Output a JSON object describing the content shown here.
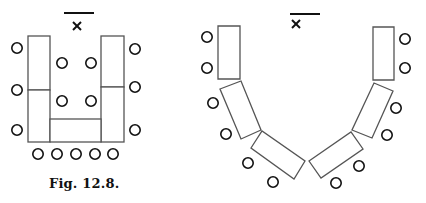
{
  "caption": "Fig. 12.8.",
  "colors": {
    "background": "#ffffff",
    "table_stroke": "#555555",
    "seat_stroke": "#111111",
    "ink": "#111111"
  },
  "legend_marks": {
    "board": "horizontal line (front of room)",
    "teacher": "x-mark (teacher position)"
  },
  "figures": [
    {
      "name": "u-shaped-layout",
      "board_line": {
        "x1": 64,
        "y1": 13,
        "x2": 94,
        "y2": 13
      },
      "teacher_mark": {
        "cx": 77,
        "cy": 26
      },
      "tables": [
        {
          "id": "left-upper",
          "x": 28,
          "y": 36,
          "w": 22,
          "h": 54
        },
        {
          "id": "left-lower",
          "x": 28,
          "y": 90,
          "w": 22,
          "h": 52
        },
        {
          "id": "right-upper",
          "x": 101,
          "y": 36,
          "w": 23,
          "h": 51
        },
        {
          "id": "right-lower",
          "x": 101,
          "y": 87,
          "w": 23,
          "h": 55
        },
        {
          "id": "bottom",
          "x": 50,
          "y": 119,
          "w": 51,
          "h": 23
        }
      ],
      "seats": [
        {
          "cx": 17,
          "cy": 48
        },
        {
          "cx": 17,
          "cy": 90
        },
        {
          "cx": 17,
          "cy": 130
        },
        {
          "cx": 135,
          "cy": 49
        },
        {
          "cx": 135,
          "cy": 87
        },
        {
          "cx": 135,
          "cy": 130
        },
        {
          "cx": 62,
          "cy": 63
        },
        {
          "cx": 91,
          "cy": 63
        },
        {
          "cx": 62,
          "cy": 101
        },
        {
          "cx": 91,
          "cy": 101
        },
        {
          "cx": 38,
          "cy": 154
        },
        {
          "cx": 57,
          "cy": 154
        },
        {
          "cx": 76,
          "cy": 154
        },
        {
          "cx": 95,
          "cy": 154
        },
        {
          "cx": 113,
          "cy": 154
        }
      ]
    },
    {
      "name": "v-shaped-layout",
      "board_line": {
        "x1": 290,
        "y1": 14,
        "x2": 320,
        "y2": 14
      },
      "teacher_mark": {
        "cx": 296,
        "cy": 24
      },
      "tables": [
        {
          "id": "left-1",
          "points": "218,26 240,26 240,79 218,79"
        },
        {
          "id": "left-2",
          "points": "220,89 241,81 261,130 241,139"
        },
        {
          "id": "left-3",
          "points": "251,148 262,131 305,161 294,179"
        },
        {
          "id": "right-3",
          "points": "309,161 351,132 363,149 321,178"
        },
        {
          "id": "right-2",
          "points": "374,83 393,91 372,138 352,130"
        },
        {
          "id": "right-1",
          "points": "373,27 394,27 394,80 373,80"
        }
      ],
      "seats": [
        {
          "cx": 207,
          "cy": 37
        },
        {
          "cx": 207,
          "cy": 68
        },
        {
          "cx": 213,
          "cy": 103
        },
        {
          "cx": 226,
          "cy": 134
        },
        {
          "cx": 248,
          "cy": 163
        },
        {
          "cx": 273,
          "cy": 182
        },
        {
          "cx": 336,
          "cy": 183
        },
        {
          "cx": 359,
          "cy": 166
        },
        {
          "cx": 387,
          "cy": 135
        },
        {
          "cx": 396,
          "cy": 108
        },
        {
          "cx": 405,
          "cy": 39
        },
        {
          "cx": 405,
          "cy": 68
        }
      ]
    }
  ]
}
